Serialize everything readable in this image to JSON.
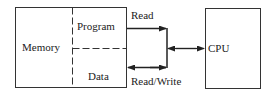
{
  "diagram": {
    "memory": {
      "label": "Memory",
      "program_label": "Program",
      "data_label": "Data"
    },
    "cpu": {
      "label": "CPU"
    },
    "connections": {
      "read_label": "Read",
      "read_write_label": "Read/Write"
    }
  }
}
